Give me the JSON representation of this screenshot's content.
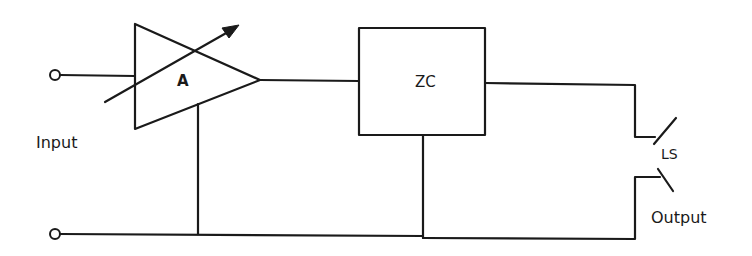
{
  "diagram": {
    "type": "block-circuit",
    "colors": {
      "line": "#1a1a1a",
      "background": "#ffffff"
    },
    "labels": {
      "input": "Input",
      "amplifier": "A",
      "zero_crossing": "ZC",
      "switch": "LS",
      "output": "Output"
    },
    "components": [
      {
        "id": "input-terminals",
        "label": "Input",
        "kind": "terminal-pair"
      },
      {
        "id": "amplifier",
        "label": "A",
        "kind": "variable-gain-amplifier"
      },
      {
        "id": "zero-crossing-block",
        "label": "ZC",
        "kind": "block"
      },
      {
        "id": "switch",
        "label": "LS",
        "kind": "switch-contacts"
      },
      {
        "id": "output-terminals",
        "label": "Output",
        "kind": "terminal-pair"
      }
    ],
    "connections": [
      {
        "from": "input-terminals",
        "to": "amplifier"
      },
      {
        "from": "amplifier",
        "to": "zero-crossing-block"
      },
      {
        "from": "zero-crossing-block",
        "to": "switch"
      },
      {
        "from": "switch",
        "to": "output-terminals"
      },
      {
        "from": "amplifier",
        "to": "common-rail"
      },
      {
        "from": "zero-crossing-block",
        "to": "common-rail"
      }
    ]
  }
}
